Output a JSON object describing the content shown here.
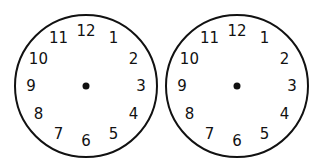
{
  "clocks": [
    {
      "name": "left-clock",
      "cx": 86,
      "cy": 86,
      "r": 71,
      "numerals": [
        "12",
        "1",
        "2",
        "3",
        "4",
        "5",
        "6",
        "7",
        "8",
        "9",
        "10",
        "11"
      ]
    },
    {
      "name": "right-clock",
      "cx": 237,
      "cy": 86,
      "r": 71,
      "numerals": [
        "12",
        "1",
        "2",
        "3",
        "4",
        "5",
        "6",
        "7",
        "8",
        "9",
        "10",
        "11"
      ]
    }
  ],
  "colors": {
    "stroke": "#111111",
    "background": "#ffffff"
  }
}
